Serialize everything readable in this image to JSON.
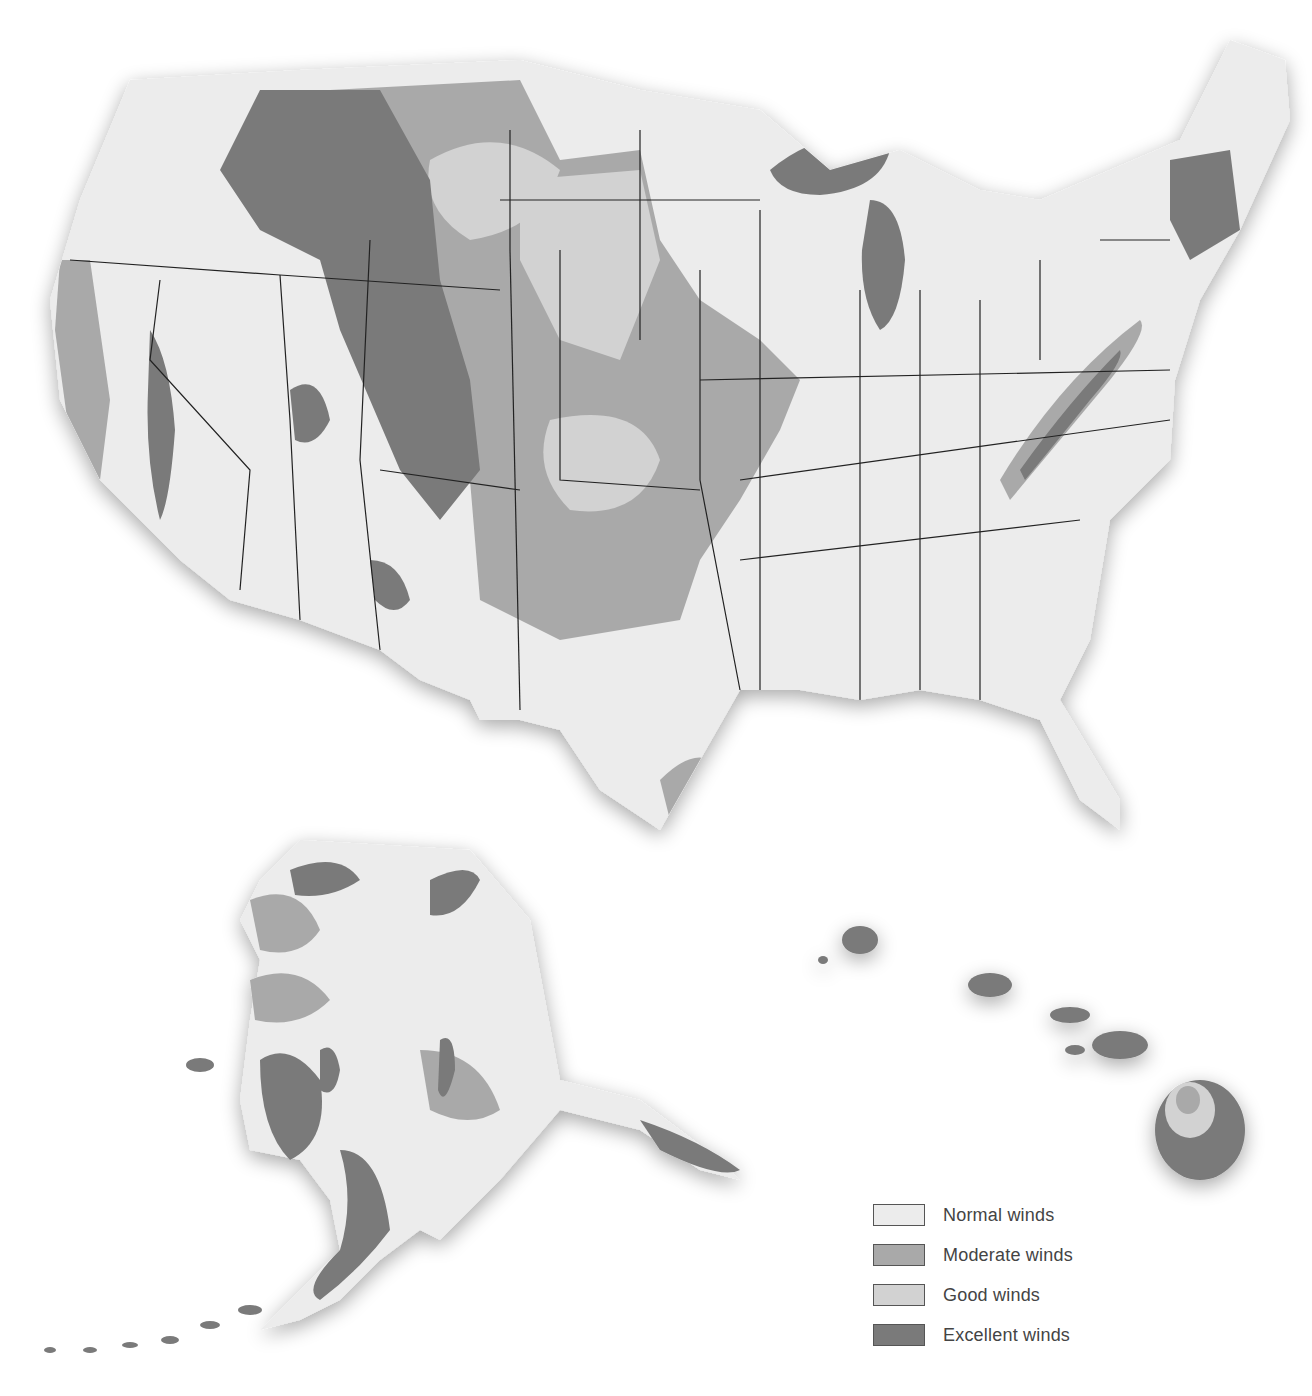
{
  "map": {
    "title": "",
    "regions": [
      "Contiguous United States",
      "Alaska",
      "Hawaii"
    ],
    "colors": {
      "normal": "#ececec",
      "moderate": "#a9a9a9",
      "good": "#d2d2d2",
      "excellent": "#7a7a7a",
      "border": "#222222"
    }
  },
  "legend": {
    "items": [
      {
        "label": "Normal winds",
        "color": "#ececec"
      },
      {
        "label": "Moderate winds",
        "color": "#a9a9a9"
      },
      {
        "label": "Good winds",
        "color": "#d2d2d2"
      },
      {
        "label": "Excellent winds",
        "color": "#7a7a7a"
      }
    ]
  }
}
